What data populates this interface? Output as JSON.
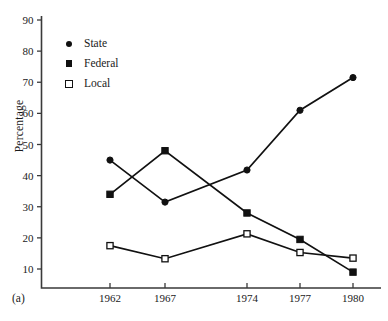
{
  "chart_data": {
    "type": "line",
    "title": "",
    "subtitle": "",
    "xlabel": "",
    "ylabel": "Percentage",
    "x": [
      1962,
      1967,
      1974,
      1977,
      1980
    ],
    "categories": [
      "1962",
      "1967",
      "1974",
      "1977",
      "1980"
    ],
    "xlim": [
      1960.2,
      1981.5
    ],
    "ylim": [
      7,
      92
    ],
    "yticks": [
      10,
      20,
      30,
      40,
      50,
      60,
      70,
      80,
      90
    ],
    "ytick_labels": [
      "10",
      "20",
      "30",
      "40",
      "50",
      "60",
      "70",
      "80",
      "90"
    ],
    "xtick_labels": [
      "1962",
      "1967",
      "1974",
      "1977",
      "1980"
    ],
    "grid": false,
    "legend_position": "upper-left",
    "series": [
      {
        "name": "State",
        "marker": "filled-circle",
        "color": "#111111",
        "values": [
          45.0,
          31.5,
          41.8,
          61.0,
          71.5
        ]
      },
      {
        "name": "Federal",
        "marker": "filled-square",
        "color": "#111111",
        "values": [
          34.0,
          48.0,
          28.0,
          19.5,
          9.0
        ]
      },
      {
        "name": "Local",
        "marker": "open-square",
        "color": "#111111",
        "values": [
          17.5,
          13.3,
          21.3,
          15.3,
          13.5
        ]
      }
    ]
  },
  "figure": {
    "caption": "(a)",
    "axis_color": "#3a3a3a",
    "line_color": "#111111",
    "background": "#ffffff"
  },
  "legend": {
    "items": [
      {
        "label": "State",
        "marker": "filled-circle"
      },
      {
        "label": "Federal",
        "marker": "filled-square"
      },
      {
        "label": "Local",
        "marker": "open-square"
      }
    ]
  }
}
